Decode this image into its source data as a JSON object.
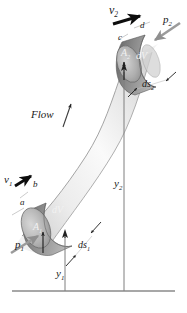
{
  "figure": {
    "background": "#ffffff",
    "ink": "#1a1a1a"
  },
  "labels": {
    "flow": "Flow",
    "v1": "v",
    "v1_sub": "1",
    "v2": "v",
    "v2_sub": "2",
    "p1": "p",
    "p1_sub": "1",
    "p2": "p",
    "p2_sub": "2",
    "A1": "A",
    "A1_sub": "1",
    "A2": "A",
    "A2_sub": "2",
    "dV_lower": "dV",
    "dV_upper": "dV",
    "ds1": "ds",
    "ds1_sub": "1",
    "ds2": "ds",
    "ds2_sub": "2",
    "y1": "y",
    "y1_sub": "1",
    "y2": "y",
    "y2_sub": "2",
    "corner_a": "a",
    "corner_b": "b",
    "corner_c": "c",
    "corner_d": "d"
  },
  "colors": {
    "tube_light": "#f4f4f4",
    "tube_mid": "#dcdcdc",
    "tube_edge": "#9a9a9a",
    "element_dark": "#6e6e6e",
    "element_darker": "#585858",
    "element_face": "#bdbdbd",
    "arrow_black": "#0d0d0d",
    "arrow_gray": "#8c8c8c",
    "datum_line": "#8a8a8a",
    "height_line": "#7f7f7f"
  },
  "geometry": {
    "datum_y": 291,
    "datum_x_start": 12,
    "datum_x_end": 175,
    "y1_line_x": 65,
    "y2_line_x": 124
  }
}
